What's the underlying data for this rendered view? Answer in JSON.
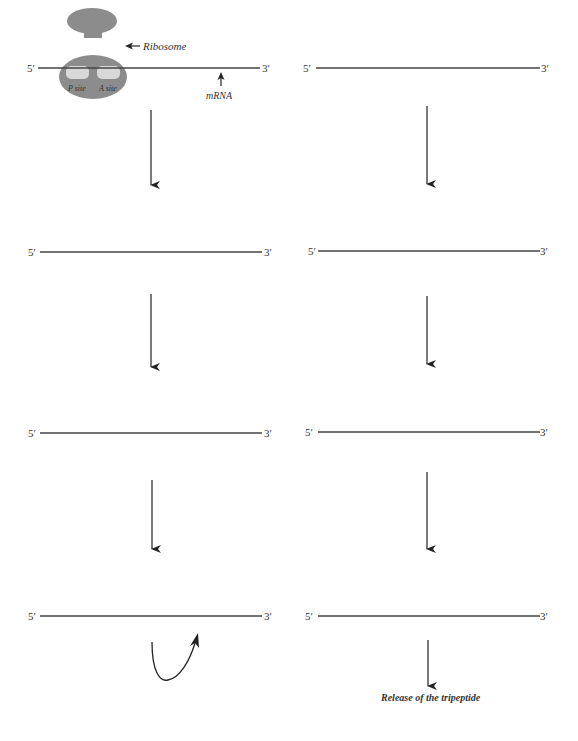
{
  "diagram": {
    "colors": {
      "line": "#444444",
      "ribosome": "#8c8c8c",
      "site": "#d8d8d8",
      "background": "#ffffff"
    },
    "labels": {
      "ribosome": "Ribosome",
      "mrna": "mRNA",
      "p_site": "P site",
      "a_site": "A site",
      "release": "Release of the tripeptide"
    },
    "strands": [
      {
        "id": "L1",
        "five": "5′",
        "three": "3′",
        "x1": 38,
        "x2": 260,
        "y": 68
      },
      {
        "id": "R1",
        "five": "5′",
        "three": "3′",
        "x1": 316,
        "x2": 540,
        "y": 68
      },
      {
        "id": "L2",
        "five": "5′",
        "three": "3′",
        "x1": 40,
        "x2": 262,
        "y": 252
      },
      {
        "id": "R2",
        "five": "5′",
        "three": "3′",
        "x1": 318,
        "x2": 540,
        "y": 251
      },
      {
        "id": "L3",
        "five": "5′",
        "three": "3′",
        "x1": 40,
        "x2": 262,
        "y": 433
      },
      {
        "id": "R3",
        "five": "5′",
        "three": "3′",
        "x1": 318,
        "x2": 540,
        "y": 432
      },
      {
        "id": "L4",
        "five": "5′",
        "three": "3′",
        "x1": 40,
        "x2": 262,
        "y": 616
      },
      {
        "id": "R4",
        "five": "5′",
        "three": "3′",
        "x1": 318,
        "x2": 540,
        "y": 616
      }
    ]
  }
}
